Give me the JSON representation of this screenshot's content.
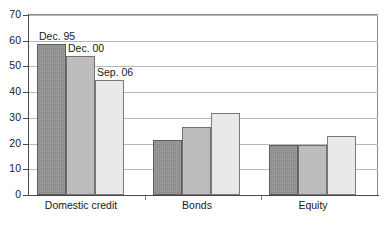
{
  "chart_data": {
    "type": "bar",
    "title": "",
    "subtitle": "",
    "xlabel": "",
    "ylabel": "",
    "categories": [
      "Domestic credit",
      "Bonds",
      "Equity"
    ],
    "series": [
      {
        "name": "Dec. 95",
        "values": [
          58.8,
          21.5,
          19.3
        ],
        "color": "#878787"
      },
      {
        "name": "Dec. 00",
        "values": [
          54.0,
          26.3,
          19.3
        ],
        "color": "#b5b5b5"
      },
      {
        "name": "Sep. 06",
        "values": [
          44.6,
          31.8,
          22.9
        ],
        "color": "#e6e6e6"
      }
    ],
    "ylim": [
      0,
      70
    ],
    "ytick_labels": [
      "0",
      "10",
      "20",
      "30",
      "40",
      "50",
      "60",
      "70"
    ],
    "ytick_values": [
      0,
      10,
      20,
      30,
      40,
      50,
      60,
      70
    ],
    "grid": true,
    "grid_axis": "y",
    "legend": "inline-annotations",
    "legend_position": "inside-first-group",
    "annotations": [
      {
        "text": "Dec. 95",
        "series": 0,
        "category": 0
      },
      {
        "text": "Dec. 00",
        "series": 1,
        "category": 0
      },
      {
        "text": "Sep. 06",
        "series": 2,
        "category": 0
      }
    ]
  }
}
